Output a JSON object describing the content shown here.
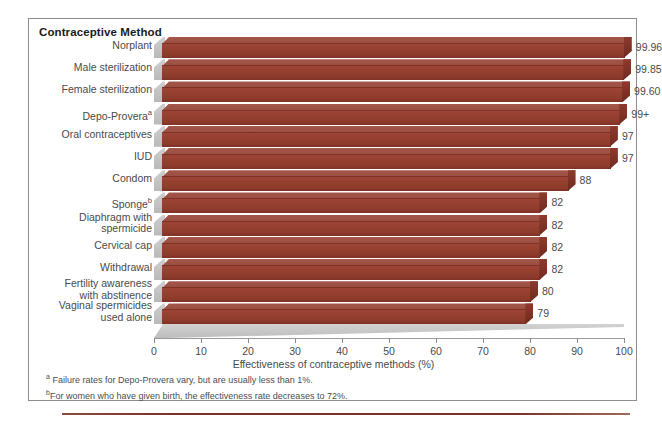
{
  "chart_data": {
    "type": "bar",
    "orientation": "horizontal",
    "title": "Contraceptive Method",
    "xlabel": "Effectiveness of contraceptive methods (%)",
    "ylabel": "Contraceptive Method",
    "xlim": [
      0,
      100
    ],
    "xticks": [
      0,
      10,
      20,
      30,
      40,
      50,
      60,
      70,
      80,
      90,
      100
    ],
    "grid": false,
    "legend": "none",
    "bar_color": "#96402f",
    "categories": [
      "Norplant",
      "Male sterilization",
      "Female sterilization",
      "Depo-Provera",
      "Oral contraceptives",
      "IUD",
      "Condom",
      "Sponge",
      "Diaphragm with spermicide",
      "Cervical cap",
      "Withdrawal",
      "Fertility awareness with abstinence",
      "Vaginal spermicides used alone"
    ],
    "values": [
      99.96,
      99.85,
      99.6,
      99,
      97,
      97,
      88,
      82,
      82,
      82,
      82,
      80,
      79
    ],
    "value_labels": [
      "99.96",
      "99.85",
      "99.60",
      "99+",
      "97",
      "97",
      "88",
      "82",
      "82",
      "82",
      "82",
      "80",
      "79"
    ],
    "category_footnote_marks": [
      "",
      "",
      "",
      "a",
      "",
      "",
      "",
      "b",
      "",
      "",
      "",
      "",
      ""
    ],
    "category_lines": [
      [
        "Norplant"
      ],
      [
        "Male sterilization"
      ],
      [
        "Female sterilization"
      ],
      [
        "Depo-Provera"
      ],
      [
        "Oral contraceptives"
      ],
      [
        "IUD"
      ],
      [
        "Condom"
      ],
      [
        "Sponge"
      ],
      [
        "Diaphragm with",
        "spermicide"
      ],
      [
        "Cervical cap"
      ],
      [
        "Withdrawal"
      ],
      [
        "Fertility awareness",
        "with abstinence"
      ],
      [
        "Vaginal spermicides",
        "used alone"
      ]
    ],
    "footnotes": [
      {
        "mark": "a",
        "text": " Failure rates for Depo-Provera vary, but are usually less than 1%."
      },
      {
        "mark": "b",
        "text": "For women who have given birth, the effectiveness rate decreases to 72%."
      }
    ]
  }
}
